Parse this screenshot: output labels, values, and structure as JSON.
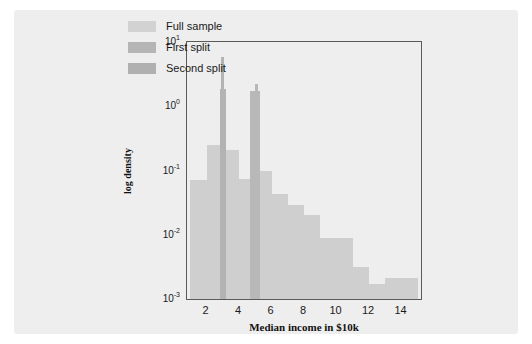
{
  "chart_data": {
    "type": "bar",
    "title": "",
    "xlabel": "Median income in $10k",
    "ylabel": "log density",
    "xlim": [
      0.8,
      15.2
    ],
    "ylim": [
      0.001,
      10
    ],
    "yscale": "log",
    "grid": false,
    "legend_position": "top-right",
    "xticks": [
      2,
      4,
      6,
      8,
      10,
      12,
      14
    ],
    "yticks": [
      "10",
      "10",
      "10",
      "10",
      "10"
    ],
    "ytick_values": [
      10,
      1,
      0.1,
      0.01,
      0.001
    ],
    "ytick_mantissa": [
      "10",
      "10",
      "10",
      "10",
      "10"
    ],
    "ytick_exponents": [
      "1",
      "0",
      "-1",
      "-2",
      "-3"
    ],
    "series": [
      {
        "name": "Full sample",
        "color": "#cfcfcf",
        "bin_edges": [
          1,
          2,
          3,
          4,
          5,
          6,
          7,
          8,
          9,
          10,
          11,
          12,
          13,
          14,
          15
        ],
        "values": [
          0.072,
          0.25,
          0.21,
          0.075,
          0.1,
          0.043,
          0.029,
          0.02,
          0.0088,
          0.0088,
          0.0031,
          0.0017,
          0.0021,
          0.0021
        ]
      },
      {
        "name": "First split",
        "color": "#b3b3b3",
        "bin_edges": [
          2.9,
          3.05
        ],
        "values": [
          5.9
        ],
        "secondary_edges": [
          2.8,
          3.2
        ],
        "secondary_values": [
          1.85
        ]
      },
      {
        "name": "Second split",
        "color": "#b8b8b8",
        "bin_edges": [
          5.0,
          5.15
        ],
        "values": [
          2.2
        ],
        "secondary_edges": [
          4.7,
          5.3
        ],
        "secondary_values": [
          1.7
        ]
      }
    ]
  },
  "legend": {
    "items": [
      {
        "label": "Full sample",
        "color": "#d2d2d2"
      },
      {
        "label": "First split",
        "color": "#b5b5b5"
      },
      {
        "label": "Second split",
        "color": "#b0b0b0"
      }
    ]
  },
  "axes": {
    "xlabel": "Median income in $10k",
    "ylabel": "log density"
  }
}
